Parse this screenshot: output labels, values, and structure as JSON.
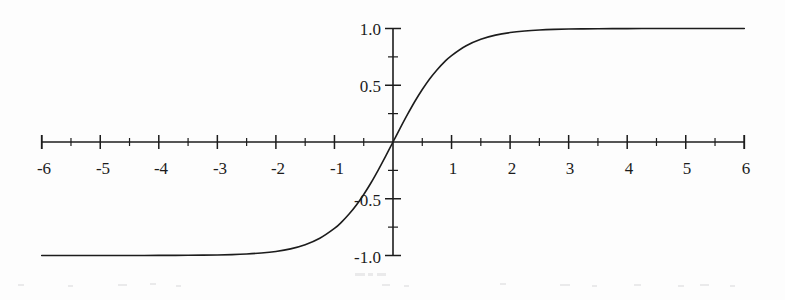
{
  "figure": {
    "background_color": "#fdfdfd",
    "ink_color": "#1c1c1c"
  },
  "chart_data": {
    "type": "line",
    "title": "",
    "subtitle": "",
    "xlabel": "",
    "ylabel": "",
    "function": "tanh(x)",
    "grid": false,
    "legend": null,
    "xlim": [
      -6,
      6
    ],
    "ylim": [
      -1.0,
      1.0
    ],
    "x_tick_labels": [
      "-6",
      "-5",
      "-4",
      "-3",
      "-2",
      "-1",
      "1",
      "2",
      "3",
      "4",
      "5",
      "6"
    ],
    "x_tick_values": [
      -6,
      -5,
      -4,
      -3,
      -2,
      -1,
      1,
      2,
      3,
      4,
      5,
      6
    ],
    "x_minor_tick_values": [
      -5.5,
      -4.5,
      -3.5,
      -2.5,
      -1.5,
      -0.5,
      0.5,
      1.5,
      2.5,
      3.5,
      4.5,
      5.5
    ],
    "y_tick_labels": [
      "1.0",
      "0.5",
      "-0.5",
      "-1.0"
    ],
    "y_tick_values": [
      1.0,
      0.5,
      -0.5,
      -1.0
    ],
    "y_minor_tick_values": [
      0.75,
      0.25,
      -0.25,
      -0.75
    ],
    "series": [
      {
        "name": "tanh(x)",
        "color": "#1c1c1c",
        "x": [
          -6.0,
          -5.75,
          -5.5,
          -5.25,
          -5.0,
          -4.75,
          -4.5,
          -4.25,
          -4.0,
          -3.75,
          -3.5,
          -3.25,
          -3.0,
          -2.75,
          -2.5,
          -2.25,
          -2.0,
          -1.75,
          -1.5,
          -1.25,
          -1.0,
          -0.875,
          -0.75,
          -0.625,
          -0.5,
          -0.375,
          -0.25,
          -0.125,
          0.0,
          0.125,
          0.25,
          0.375,
          0.5,
          0.625,
          0.75,
          0.875,
          1.0,
          1.25,
          1.5,
          1.75,
          2.0,
          2.25,
          2.5,
          2.75,
          3.0,
          3.25,
          3.5,
          3.75,
          4.0,
          4.25,
          4.5,
          4.75,
          5.0,
          5.25,
          5.5,
          5.75,
          6.0
        ],
        "y": [
          -0.9999877,
          -0.9999797,
          -0.9999665,
          -0.9999448,
          -0.9999092,
          -0.99985,
          -0.999753,
          -0.999593,
          -0.999329,
          -0.998894,
          -0.998178,
          -0.996998,
          -0.995055,
          -0.991859,
          -0.986614,
          -0.978026,
          -0.964028,
          -0.941376,
          -0.905148,
          -0.848284,
          -0.761594,
          -0.703906,
          -0.635149,
          -0.555403,
          -0.462117,
          -0.358729,
          -0.244919,
          -0.124353,
          0.0,
          0.124353,
          0.244919,
          0.358729,
          0.462117,
          0.555403,
          0.635149,
          0.703906,
          0.761594,
          0.848284,
          0.905148,
          0.941376,
          0.964028,
          0.978026,
          0.986614,
          0.991859,
          0.995055,
          0.996998,
          0.998178,
          0.998894,
          0.999329,
          0.999593,
          0.999753,
          0.99985,
          0.9999092,
          0.9999448,
          0.9999665,
          0.9999797,
          0.9999877
        ]
      }
    ],
    "annotations": []
  }
}
